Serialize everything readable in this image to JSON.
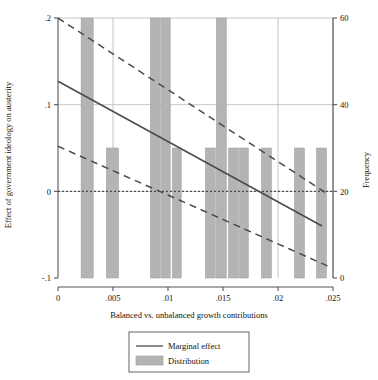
{
  "chart_data": {
    "type": "line",
    "title": "",
    "subtitle": "",
    "xlabel": "Balanced vs. unbalanced growth contributions",
    "ylabel": "Effect of government ideology on austerity",
    "y2label": "Frequency",
    "xlim": [
      0,
      0.025
    ],
    "ylim": [
      -0.1,
      0.2
    ],
    "y2lim": [
      0,
      60
    ],
    "grid": true,
    "legend_position": "bottom-center",
    "xticks": [
      0,
      0.005,
      0.01,
      0.015,
      0.02,
      0.025
    ],
    "xtick_labels": [
      "0",
      ".005",
      ".01",
      ".015",
      ".02",
      ".025"
    ],
    "yticks": [
      -0.1,
      0,
      0.1,
      0.2
    ],
    "ytick_labels": [
      "-.1",
      "0",
      ".1",
      ".2"
    ],
    "y2ticks": [
      0,
      20,
      40,
      60
    ],
    "y2tick_labels": [
      "0",
      "20",
      "40",
      "60"
    ],
    "zero_reference_line": 0,
    "series": [
      {
        "name": "Marginal effect",
        "style": "solid",
        "x": [
          0,
          0.024
        ],
        "values": [
          0.127,
          -0.04
        ]
      },
      {
        "name": "Upper confidence bound",
        "style": "dashed",
        "x": [
          0,
          0.0245
        ],
        "values": [
          0.2,
          -0.003
        ]
      },
      {
        "name": "Lower confidence bound",
        "style": "dashed",
        "x": [
          0,
          0.0245
        ],
        "values": [
          0.052,
          -0.086
        ]
      }
    ],
    "histogram": {
      "name": "Distribution",
      "axis": "y2",
      "bar_color": "#b4b4b4",
      "bins": [
        {
          "x": 0.0021,
          "width": 0.0011,
          "frequency": 60
        },
        {
          "x": 0.0044,
          "width": 0.0011,
          "frequency": 30
        },
        {
          "x": 0.0084,
          "width": 0.0009,
          "frequency": 60
        },
        {
          "x": 0.0094,
          "width": 0.0008,
          "frequency": 60
        },
        {
          "x": 0.0104,
          "width": 0.0008,
          "frequency": 30
        },
        {
          "x": 0.0134,
          "width": 0.0009,
          "frequency": 30
        },
        {
          "x": 0.0144,
          "width": 0.0009,
          "frequency": 60
        },
        {
          "x": 0.0155,
          "width": 0.0009,
          "frequency": 30
        },
        {
          "x": 0.0165,
          "width": 0.0008,
          "frequency": 30
        },
        {
          "x": 0.0185,
          "width": 0.0009,
          "frequency": 30
        },
        {
          "x": 0.0215,
          "width": 0.0009,
          "frequency": 30
        },
        {
          "x": 0.0235,
          "width": 0.0009,
          "frequency": 30
        }
      ]
    },
    "legend": [
      {
        "label": "Marginal effect",
        "marker": "line"
      },
      {
        "label": "Distribution",
        "marker": "bar"
      }
    ]
  },
  "colors": {
    "line": "#4a4a4a",
    "bar": "#b4b4b4",
    "bar_edge": "#9a9a9a",
    "grid": "#b0b0b0",
    "axis": "#555555",
    "text": "#111111"
  }
}
